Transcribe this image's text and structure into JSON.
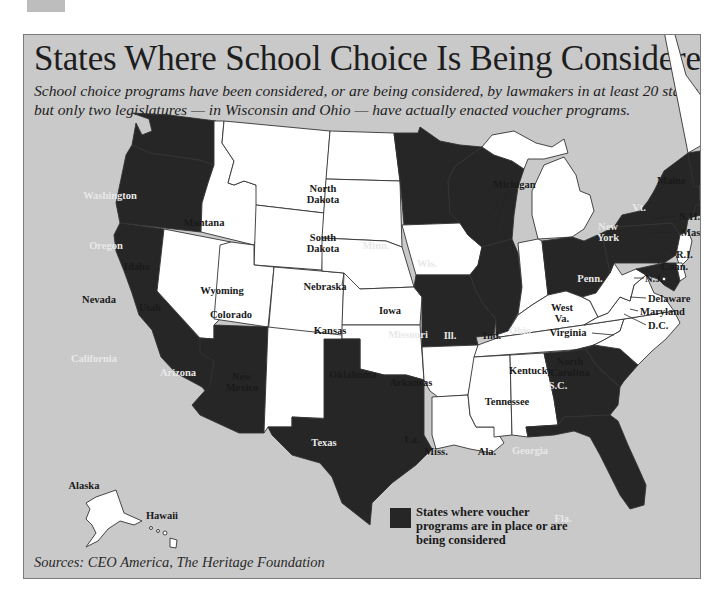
{
  "title": "States Where School Choice Is Being Considered",
  "subtitle": "School choice programs have been considered, or are being considered, by lawmakers in at least 20 states, but only two legislatures — in Wisconsin and Ohio — have actually enacted voucher programs.",
  "sources": "Sources: CEO America, The Heritage Foundation",
  "legend": {
    "label": "States where voucher programs are in place or are being considered",
    "color": "#262626"
  },
  "colors": {
    "selected": "#262626",
    "unselected": "#ffffff",
    "water": "#c9c9c9"
  },
  "states": {
    "washington": {
      "label": "Washington",
      "selected": true
    },
    "oregon": {
      "label": "Oregon",
      "selected": true
    },
    "california": {
      "label": "California",
      "selected": true
    },
    "idaho": {
      "label": "Idaho",
      "selected": false
    },
    "nevada": {
      "label": "Nevada",
      "selected": false
    },
    "montana": {
      "label": "Montana",
      "selected": false
    },
    "wyoming": {
      "label": "Wyoming",
      "selected": false
    },
    "utah": {
      "label": "Utah",
      "selected": false
    },
    "colorado": {
      "label": "Colorado",
      "selected": false
    },
    "arizona": {
      "label": "Arizona",
      "selected": true
    },
    "new_mexico": {
      "label1": "New",
      "label2": "Mexico",
      "selected": false
    },
    "north_dakota": {
      "label1": "North",
      "label2": "Dakota",
      "selected": false
    },
    "south_dakota": {
      "label1": "South",
      "label2": "Dakota",
      "selected": false
    },
    "nebraska": {
      "label": "Nebraska",
      "selected": false
    },
    "kansas": {
      "label": "Kansas",
      "selected": false
    },
    "oklahoma": {
      "label": "Oklahoma",
      "selected": false
    },
    "texas": {
      "label": "Texas",
      "selected": true
    },
    "minnesota": {
      "label": "Minn.",
      "selected": true
    },
    "iowa": {
      "label": "Iowa",
      "selected": false
    },
    "missouri": {
      "label": "Missouri",
      "selected": true
    },
    "arkansas": {
      "label": "Arkansas",
      "selected": false
    },
    "louisiana": {
      "label": "La.",
      "selected": false
    },
    "wisconsin": {
      "label": "Wis.",
      "selected": true
    },
    "illinois": {
      "label": "Ill.",
      "selected": true
    },
    "michigan": {
      "label": "Michigan",
      "selected": false
    },
    "indiana": {
      "label": "Ind.",
      "selected": false
    },
    "ohio": {
      "label": "Ohio",
      "selected": true
    },
    "kentucky": {
      "label": "Kentucky",
      "selected": false
    },
    "tennessee": {
      "label": "Tennessee",
      "selected": false
    },
    "mississippi": {
      "label": "Miss.",
      "selected": false
    },
    "alabama": {
      "label": "Ala.",
      "selected": false
    },
    "georgia": {
      "label": "Georgia",
      "selected": true
    },
    "florida": {
      "label": "Fla.",
      "selected": true
    },
    "south_carolina": {
      "label": "S.C.",
      "selected": true
    },
    "north_carolina": {
      "label1": "North",
      "label2": "Carolina",
      "selected": false
    },
    "virginia": {
      "label": "Virginia",
      "selected": false
    },
    "west_virginia": {
      "label1": "West",
      "label2": "Va.",
      "selected": false
    },
    "pennsylvania": {
      "label": "Penn.",
      "selected": true
    },
    "new_york": {
      "label1": "New",
      "label2": "York",
      "selected": true
    },
    "vermont": {
      "label": "Vt.",
      "selected": true
    },
    "maine": {
      "label": "Maine",
      "selected": false
    },
    "new_hampshire": {
      "label": "N.H.",
      "selected": false
    },
    "massachusetts": {
      "label": "Mass.",
      "selected": false
    },
    "rhode_island": {
      "label": "R.I.",
      "selected": false
    },
    "connecticut": {
      "label": "Conn.",
      "selected": true
    },
    "new_jersey": {
      "label": "N.J.",
      "selected": false
    },
    "delaware": {
      "label": "Delaware",
      "selected": false
    },
    "maryland": {
      "label": "Maryland",
      "selected": true
    },
    "dc": {
      "label": "D.C.",
      "selected": false
    },
    "alaska": {
      "label": "Alaska",
      "selected": false
    },
    "hawaii": {
      "label": "Hawaii",
      "selected": false
    }
  }
}
